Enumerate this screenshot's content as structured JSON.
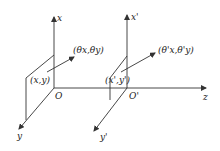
{
  "diagram": {
    "type": "coordinate-system-propagation",
    "colors": {
      "line": "#333333",
      "text": "#222222",
      "background": "#ffffff"
    },
    "input_plane": {
      "axes": {
        "x": "x",
        "y": "y",
        "origin": "O"
      },
      "point_label": "(x,y)",
      "ray_label": "(θx,θy)"
    },
    "output_plane": {
      "axes": {
        "x": "x'",
        "y": "y'",
        "origin": "O'"
      },
      "point_label": "(x',y')",
      "ray_label": "(θ'x,θ'y)"
    },
    "optical_axis": "z"
  }
}
